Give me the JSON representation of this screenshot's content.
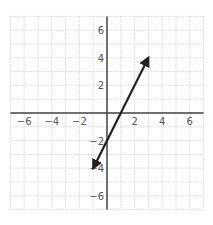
{
  "chart_data": {
    "type": "line",
    "title": "",
    "xlabel": "",
    "ylabel": "",
    "xlim": [
      -7,
      7
    ],
    "ylim": [
      -7,
      7
    ],
    "grid": true,
    "grid_step": 1,
    "x_ticks": [
      -6,
      -4,
      -2,
      2,
      4,
      6
    ],
    "y_ticks": [
      6,
      4,
      2,
      -2,
      -4,
      -6
    ],
    "x_tick_labels": [
      "−6",
      "−4",
      "−2",
      "2",
      "4",
      "6"
    ],
    "y_tick_labels": [
      "6",
      "4",
      "2",
      "−2",
      "−4",
      "−6"
    ],
    "series": [
      {
        "name": "line",
        "equation": "y = 2x - 2",
        "x": [
          -1,
          3
        ],
        "y": [
          -4,
          4
        ],
        "arrows": "both",
        "color": "#222222"
      }
    ]
  },
  "colors": {
    "grid": "#cfcfcf",
    "axis": "#444444",
    "line": "#222222"
  }
}
